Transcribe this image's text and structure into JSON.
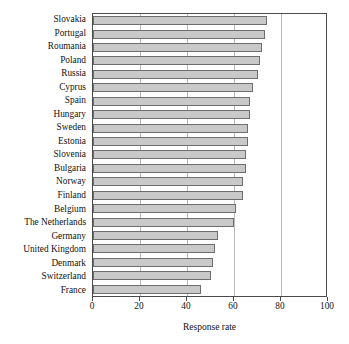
{
  "chart_data": {
    "type": "bar",
    "orientation": "horizontal",
    "title": "",
    "xlabel": "Response rate",
    "ylabel": "",
    "xlim": [
      0,
      100
    ],
    "xticks": [
      0,
      20,
      40,
      60,
      80,
      100
    ],
    "grid": true,
    "legend": null,
    "categories": [
      "Slovakia",
      "Portugal",
      "Roumania",
      "Poland",
      "Russia",
      "Cyprus",
      "Spain",
      "Hungary",
      "Sweden",
      "Estonia",
      "Slovenia",
      "Bulgaria",
      "Norway",
      "Finland",
      "Belgium",
      "The Netherlands",
      "Germany",
      "United Kingdom",
      "Denmark",
      "Switzerland",
      "France"
    ],
    "values": [
      74,
      73,
      72,
      71,
      70,
      68,
      67,
      67,
      66,
      66,
      65,
      65,
      64,
      64,
      61,
      60,
      53,
      52,
      51,
      50,
      46
    ],
    "bar_color": "#c9c9c9",
    "bar_edge_color": "#6e6e6e",
    "axis_color": "#4a4a4a",
    "grid_color": "#b9b9b9"
  }
}
